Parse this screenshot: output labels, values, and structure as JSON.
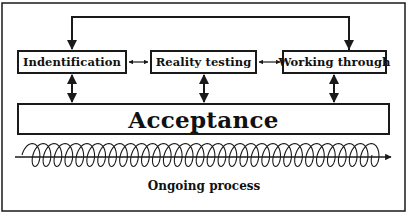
{
  "diagram": {
    "stages": [
      {
        "id": "identification",
        "label": "Indentification"
      },
      {
        "id": "reality-testing",
        "label": "Reality testing"
      },
      {
        "id": "working-through",
        "label": "Working through"
      }
    ],
    "outcome": {
      "label": "Acceptance"
    },
    "process": {
      "label": "Ongoing process"
    },
    "connections": [
      {
        "from": "Working through",
        "to": "Indentification",
        "type": "feedback-loop-over-top"
      },
      {
        "from": "Indentification",
        "to": "Reality testing",
        "type": "bidirectional"
      },
      {
        "from": "Reality testing",
        "to": "Working through",
        "type": "bidirectional"
      },
      {
        "from": "Indentification",
        "to": "Acceptance",
        "type": "bidirectional"
      },
      {
        "from": "Reality testing",
        "to": "Acceptance",
        "type": "bidirectional"
      },
      {
        "from": "Working through",
        "to": "Acceptance",
        "type": "bidirectional"
      }
    ],
    "colors": {
      "stroke": "#1a1a1a",
      "background": "#ffffff"
    }
  }
}
